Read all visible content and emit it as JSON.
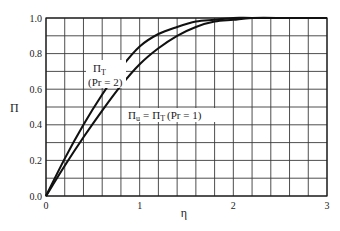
{
  "chart_data": {
    "type": "line",
    "title": "",
    "xlabel": "η",
    "ylabel": "Π",
    "xlim": [
      0,
      3
    ],
    "ylim": [
      0.0,
      1.0
    ],
    "x_ticks": [
      "0",
      "1",
      "2",
      "3"
    ],
    "y_ticks": [
      "0.0",
      "0.2",
      "0.4",
      "0.6",
      "0.8",
      "1.0"
    ],
    "grid": true,
    "grid_x_step": 0.2,
    "grid_y_step": 0.1,
    "legend": "none (curves annotated inline)",
    "series": [
      {
        "name": "Π_T (Pr = 2)",
        "x": [
          0,
          0.2,
          0.4,
          0.6,
          0.8,
          1.0,
          1.2,
          1.4,
          1.6,
          1.8,
          2.0,
          2.2,
          2.6,
          3.0
        ],
        "values": [
          0.0,
          0.21,
          0.4,
          0.57,
          0.72,
          0.84,
          0.91,
          0.95,
          0.98,
          0.99,
          1.0,
          1.0,
          1.0,
          1.0
        ]
      },
      {
        "name": "Π_u = Π_T (Pr = 1)",
        "x": [
          0,
          0.2,
          0.4,
          0.6,
          0.8,
          1.0,
          1.2,
          1.4,
          1.6,
          1.8,
          2.0,
          2.2,
          2.6,
          3.0
        ],
        "values": [
          0.0,
          0.17,
          0.33,
          0.48,
          0.62,
          0.74,
          0.83,
          0.9,
          0.95,
          0.98,
          0.99,
          1.0,
          1.0,
          1.0
        ]
      }
    ],
    "annotations": [
      {
        "text": "Π_T",
        "main": "Π",
        "sub": "T",
        "line2": "(Pr = 2)",
        "x": 0.45,
        "y": 0.67
      },
      {
        "text": "Π_u = Π_T (Pr = 1)",
        "x": 0.85,
        "y": 0.42
      }
    ]
  },
  "labels": {
    "x_axis": "η",
    "y_axis": "Π",
    "anno1_main": "Π",
    "anno1_sub": "T",
    "anno1_line2": "(Pr = 2)",
    "anno2_lhs_main": "Π",
    "anno2_lhs_sub": "u",
    "anno2_eq": "=",
    "anno2_rhs_main": "Π",
    "anno2_rhs_sub": "T",
    "anno2_paren": "(Pr = 1)"
  }
}
